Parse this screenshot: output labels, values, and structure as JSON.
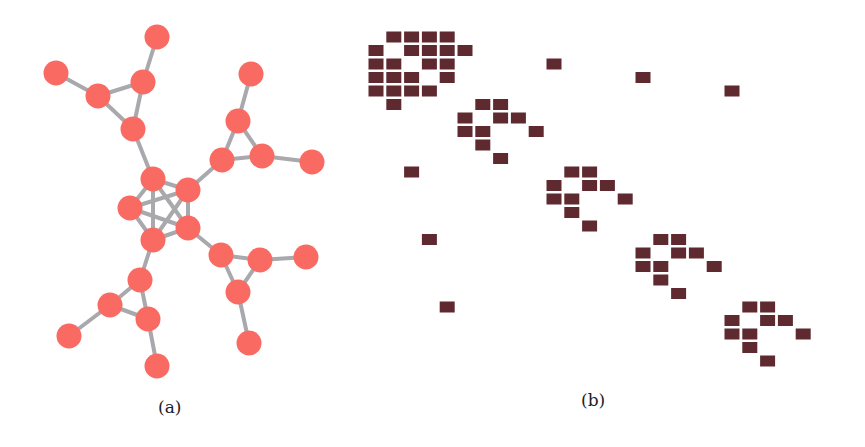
{
  "figure": {
    "panel_a": {
      "label": "(a)",
      "type": "graph",
      "colors": {
        "node": "#f96a62",
        "edge": "#a9a9ad"
      },
      "node_radius": 12.5,
      "nodes": [
        {
          "id": 0,
          "x": 153,
          "y": 179
        },
        {
          "id": 1,
          "x": 188,
          "y": 190
        },
        {
          "id": 2,
          "x": 130,
          "y": 208
        },
        {
          "id": 3,
          "x": 188,
          "y": 228
        },
        {
          "id": 4,
          "x": 153,
          "y": 240
        },
        {
          "id": 5,
          "x": 133,
          "y": 129
        },
        {
          "id": 6,
          "x": 98,
          "y": 96
        },
        {
          "id": 7,
          "x": 143,
          "y": 82
        },
        {
          "id": 8,
          "x": 56,
          "y": 73
        },
        {
          "id": 9,
          "x": 157,
          "y": 37
        },
        {
          "id": 10,
          "x": 222,
          "y": 160
        },
        {
          "id": 11,
          "x": 238,
          "y": 121
        },
        {
          "id": 12,
          "x": 262,
          "y": 156
        },
        {
          "id": 13,
          "x": 251,
          "y": 74
        },
        {
          "id": 14,
          "x": 312,
          "y": 162
        },
        {
          "id": 15,
          "x": 221,
          "y": 255
        },
        {
          "id": 16,
          "x": 260,
          "y": 260
        },
        {
          "id": 17,
          "x": 238,
          "y": 292
        },
        {
          "id": 18,
          "x": 306,
          "y": 257
        },
        {
          "id": 19,
          "x": 249,
          "y": 343
        },
        {
          "id": 20,
          "x": 140,
          "y": 280
        },
        {
          "id": 21,
          "x": 110,
          "y": 305
        },
        {
          "id": 22,
          "x": 148,
          "y": 319
        },
        {
          "id": 23,
          "x": 69,
          "y": 336
        },
        {
          "id": 24,
          "x": 157,
          "y": 366
        }
      ],
      "edges": [
        [
          0,
          1
        ],
        [
          0,
          2
        ],
        [
          0,
          3
        ],
        [
          0,
          4
        ],
        [
          1,
          2
        ],
        [
          1,
          3
        ],
        [
          1,
          4
        ],
        [
          2,
          3
        ],
        [
          2,
          4
        ],
        [
          3,
          4
        ],
        [
          0,
          5
        ],
        [
          5,
          6
        ],
        [
          5,
          7
        ],
        [
          6,
          7
        ],
        [
          6,
          8
        ],
        [
          7,
          9
        ],
        [
          1,
          10
        ],
        [
          10,
          11
        ],
        [
          10,
          12
        ],
        [
          11,
          12
        ],
        [
          11,
          13
        ],
        [
          12,
          14
        ],
        [
          3,
          15
        ],
        [
          15,
          16
        ],
        [
          15,
          17
        ],
        [
          16,
          17
        ],
        [
          16,
          18
        ],
        [
          17,
          19
        ],
        [
          4,
          20
        ],
        [
          20,
          21
        ],
        [
          20,
          22
        ],
        [
          21,
          22
        ],
        [
          21,
          23
        ],
        [
          22,
          24
        ]
      ]
    },
    "panel_b": {
      "label": "(b)",
      "type": "adjacency-matrix",
      "colors": {
        "cell": "#5e2a30"
      },
      "grid": {
        "origin_x": 376,
        "origin_y": 37,
        "col_step": 17.8,
        "row_step": 13.5,
        "cell_w": 15,
        "cell_h": 11
      },
      "cells": [
        [
          0,
          1
        ],
        [
          0,
          2
        ],
        [
          0,
          3
        ],
        [
          0,
          4
        ],
        [
          1,
          0
        ],
        [
          1,
          2
        ],
        [
          1,
          3
        ],
        [
          1,
          4
        ],
        [
          1,
          5
        ],
        [
          2,
          0
        ],
        [
          2,
          1
        ],
        [
          2,
          3
        ],
        [
          2,
          4
        ],
        [
          2,
          10
        ],
        [
          3,
          0
        ],
        [
          3,
          1
        ],
        [
          3,
          2
        ],
        [
          3,
          4
        ],
        [
          3,
          15
        ],
        [
          4,
          0
        ],
        [
          4,
          1
        ],
        [
          4,
          2
        ],
        [
          4,
          3
        ],
        [
          4,
          20
        ],
        [
          5,
          1
        ],
        [
          5,
          6
        ],
        [
          5,
          7
        ],
        [
          6,
          5
        ],
        [
          6,
          7
        ],
        [
          6,
          8
        ],
        [
          7,
          5
        ],
        [
          7,
          6
        ],
        [
          7,
          9
        ],
        [
          8,
          6
        ],
        [
          9,
          7
        ],
        [
          10,
          2
        ],
        [
          10,
          11
        ],
        [
          10,
          12
        ],
        [
          11,
          10
        ],
        [
          11,
          12
        ],
        [
          11,
          13
        ],
        [
          12,
          10
        ],
        [
          12,
          11
        ],
        [
          12,
          14
        ],
        [
          13,
          11
        ],
        [
          14,
          12
        ],
        [
          15,
          3
        ],
        [
          15,
          16
        ],
        [
          15,
          17
        ],
        [
          16,
          15
        ],
        [
          16,
          17
        ],
        [
          16,
          18
        ],
        [
          17,
          15
        ],
        [
          17,
          16
        ],
        [
          17,
          19
        ],
        [
          18,
          16
        ],
        [
          19,
          17
        ],
        [
          20,
          4
        ],
        [
          20,
          21
        ],
        [
          20,
          22
        ],
        [
          21,
          20
        ],
        [
          21,
          22
        ],
        [
          21,
          23
        ],
        [
          22,
          20
        ],
        [
          22,
          21
        ],
        [
          22,
          24
        ],
        [
          23,
          21
        ],
        [
          24,
          22
        ]
      ]
    }
  }
}
